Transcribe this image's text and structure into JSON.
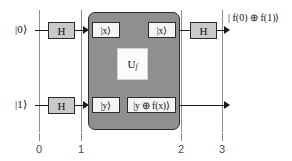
{
  "diagram": {
    "colors": {
      "oracle_fill": "#8f8f8f",
      "gate_fill": "#c9c9c9",
      "register_fill": "#f4f4f4",
      "wire": "#1a1a1a",
      "timeline": "#8e8e8e"
    }
  },
  "inputs": {
    "qubit0_label": "|0⟩",
    "qubit1_label": "|1⟩"
  },
  "gates": {
    "h_top_left_label": "H",
    "h_bottom_left_label": "H",
    "h_top_right_label": "H"
  },
  "oracle": {
    "name_U": "U",
    "name_sub": "f",
    "in_top_label": "|x⟩",
    "in_bottom_label": "|y⟩",
    "out_top_label": "|x⟩",
    "out_bottom_label": "|y ⊕ f(x)⟩"
  },
  "outputs": {
    "top_label": "| f(0) ⊕ f(1)⟩"
  },
  "timeline": {
    "ticks": [
      {
        "label": "0"
      },
      {
        "label": "1"
      },
      {
        "label": "2"
      },
      {
        "label": "3"
      }
    ]
  }
}
